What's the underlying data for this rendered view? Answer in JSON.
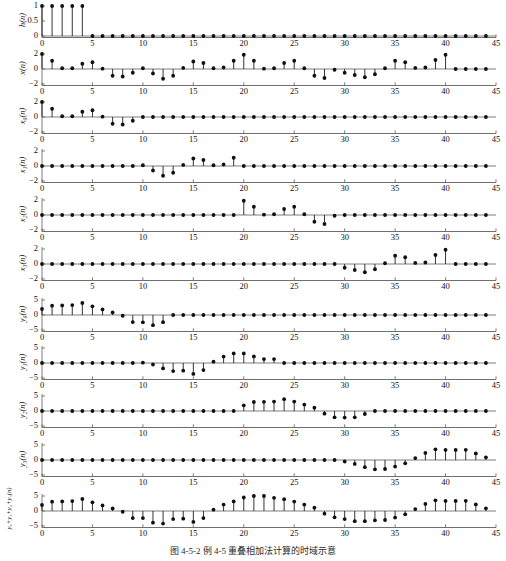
{
  "figure": {
    "caption": "图 4-5-2   例 4-5 重叠相加法计算的时域示意",
    "width": 506,
    "height": 561,
    "stem_color": "#101010",
    "axis_color": "#6f6f6f",
    "background": "#ffffff"
  },
  "axes": {
    "xlabel": "",
    "xticks": [
      0,
      5,
      10,
      15,
      20,
      25,
      30,
      35,
      40,
      45
    ],
    "xlim": [
      0,
      45
    ],
    "yticks_unit": [
      "1",
      "0.5",
      "0"
    ],
    "yticks_two": [
      "2",
      "0",
      "−2"
    ],
    "yticks_five": [
      "5",
      "0",
      "−5"
    ]
  },
  "chart_data": {
    "type": "line",
    "subtype": "stem",
    "title": "图 4-5-2   例 4-5 重叠相加法计算的时域示意",
    "xlabel": "n",
    "shared_x": [
      0,
      1,
      2,
      3,
      4,
      5,
      6,
      7,
      8,
      9,
      10,
      11,
      12,
      13,
      14,
      15,
      16,
      17,
      18,
      19,
      20,
      21,
      22,
      23,
      24,
      25,
      26,
      27,
      28,
      29,
      30,
      31,
      32,
      33,
      34,
      35,
      36,
      37,
      38,
      39,
      40,
      41,
      42,
      43,
      44
    ],
    "grid": false,
    "legend": null,
    "panels": [
      {
        "name": "h",
        "ylabel": "h(n)",
        "ylim": [
          0,
          1
        ],
        "yticks": [
          0,
          0.5,
          1
        ],
        "ytick_labels": [
          "0",
          "0.5",
          "1"
        ],
        "values": [
          1,
          1,
          1,
          1,
          1,
          0,
          0,
          0,
          0,
          0,
          0,
          0,
          0,
          0,
          0,
          0,
          0,
          0,
          0,
          0,
          0,
          0,
          0,
          0,
          0,
          0,
          0,
          0,
          0,
          0,
          0,
          0,
          0,
          0,
          0,
          0,
          0,
          0,
          0,
          0,
          0,
          0,
          0,
          0,
          0
        ]
      },
      {
        "name": "x",
        "ylabel": "x(n)",
        "ylim": [
          -2,
          2
        ],
        "yticks": [
          -2,
          0,
          2
        ],
        "ytick_labels": [
          "−2",
          "0",
          "2"
        ],
        "values": [
          2.0,
          1.1,
          0.1,
          0.1,
          0.7,
          0.9,
          0.05,
          -0.9,
          -1.0,
          -0.5,
          0.1,
          -0.6,
          -1.3,
          -0.9,
          0.15,
          1.0,
          0.8,
          0.1,
          0.2,
          1.1,
          1.9,
          1.1,
          0.05,
          0.1,
          0.8,
          1.1,
          0.1,
          -0.9,
          -1.2,
          -0.1,
          -0.5,
          -0.8,
          -1.1,
          -0.7,
          0.1,
          1.1,
          0.9,
          0.15,
          0.2,
          1.2,
          1.9,
          0,
          0,
          0,
          0
        ]
      },
      {
        "name": "x0",
        "ylabel": "x₀(n)",
        "ylim": [
          -2,
          2
        ],
        "yticks": [
          -2,
          0,
          2
        ],
        "ytick_labels": [
          "−2",
          "0",
          "2"
        ],
        "values": [
          2.0,
          1.1,
          0.1,
          0.1,
          0.7,
          0.9,
          0.05,
          -0.9,
          -1.0,
          -0.5,
          0,
          0,
          0,
          0,
          0,
          0,
          0,
          0,
          0,
          0,
          0,
          0,
          0,
          0,
          0,
          0,
          0,
          0,
          0,
          0,
          0,
          0,
          0,
          0,
          0,
          0,
          0,
          0,
          0,
          0,
          0,
          0,
          0,
          0,
          0
        ]
      },
      {
        "name": "x1",
        "ylabel": "x₁(n)",
        "ylim": [
          -2,
          2
        ],
        "yticks": [
          -2,
          0,
          2
        ],
        "ytick_labels": [
          "−2",
          "0",
          "2"
        ],
        "values": [
          0,
          0,
          0,
          0,
          0,
          0,
          0,
          0,
          0,
          0,
          0.1,
          -0.6,
          -1.3,
          -0.9,
          0.15,
          1.0,
          0.8,
          0.1,
          0.2,
          1.1,
          0,
          0,
          0,
          0,
          0,
          0,
          0,
          0,
          0,
          0,
          0,
          0,
          0,
          0,
          0,
          0,
          0,
          0,
          0,
          0,
          0,
          0,
          0,
          0,
          0
        ]
      },
      {
        "name": "x2",
        "ylabel": "x₂(n)",
        "ylim": [
          -2,
          2
        ],
        "yticks": [
          -2,
          0,
          2
        ],
        "ytick_labels": [
          "−2",
          "0",
          "2"
        ],
        "values": [
          0,
          0,
          0,
          0,
          0,
          0,
          0,
          0,
          0,
          0,
          0,
          0,
          0,
          0,
          0,
          0,
          0,
          0,
          0,
          0,
          1.9,
          1.1,
          0.05,
          0.1,
          0.8,
          1.1,
          0.1,
          -0.9,
          -1.2,
          -0.1,
          0,
          0,
          0,
          0,
          0,
          0,
          0,
          0,
          0,
          0,
          0,
          0,
          0,
          0,
          0
        ]
      },
      {
        "name": "x3",
        "ylabel": "x₃(n)",
        "ylim": [
          -2,
          2
        ],
        "yticks": [
          -2,
          0,
          2
        ],
        "ytick_labels": [
          "−2",
          "0",
          "2"
        ],
        "values": [
          0,
          0,
          0,
          0,
          0,
          0,
          0,
          0,
          0,
          0,
          0,
          0,
          0,
          0,
          0,
          0,
          0,
          0,
          0,
          0,
          0,
          0,
          0,
          0,
          0,
          0,
          0,
          0,
          0,
          0,
          -0.5,
          -0.8,
          -1.1,
          -0.7,
          0.1,
          1.1,
          0.9,
          0.15,
          0.2,
          1.2,
          1.9,
          0,
          0,
          0,
          0
        ]
      },
      {
        "name": "y0",
        "ylabel": "y₀(n)",
        "ylim": [
          -5,
          5
        ],
        "yticks": [
          -5,
          0,
          5
        ],
        "ytick_labels": [
          "−5",
          "0",
          "5"
        ],
        "values": [
          2.0,
          3.1,
          3.2,
          3.3,
          4.0,
          2.9,
          1.85,
          0.85,
          -0.25,
          -2.35,
          -2.45,
          -3.4,
          -2.4,
          0,
          0,
          0,
          0,
          0,
          0,
          0,
          0,
          0,
          0,
          0,
          0,
          0,
          0,
          0,
          0,
          0,
          0,
          0,
          0,
          0,
          0,
          0,
          0,
          0,
          0,
          0,
          0,
          0,
          0,
          0,
          0
        ]
      },
      {
        "name": "y1",
        "ylabel": "y₁(n)",
        "ylim": [
          -5,
          5
        ],
        "yticks": [
          -5,
          0,
          5
        ],
        "ytick_labels": [
          "−5",
          "0",
          "5"
        ],
        "values": [
          0,
          0,
          0,
          0,
          0,
          0,
          0,
          0,
          0,
          0,
          0.1,
          -0.5,
          -1.8,
          -2.7,
          -2.55,
          -3.65,
          -2.35,
          0.45,
          2.15,
          3.2,
          3.2,
          2.2,
          1.3,
          1.3,
          0,
          0,
          0,
          0,
          0,
          0,
          0,
          0,
          0,
          0,
          0,
          0,
          0,
          0,
          0,
          0,
          0,
          0,
          0,
          0,
          0
        ]
      },
      {
        "name": "y2",
        "ylabel": "y₂(n)",
        "ylim": [
          -5,
          5
        ],
        "yticks": [
          -5,
          0,
          5
        ],
        "ytick_labels": [
          "−5",
          "0",
          "5"
        ],
        "values": [
          0,
          0,
          0,
          0,
          0,
          0,
          0,
          0,
          0,
          0,
          0,
          0,
          0,
          0,
          0,
          0,
          0,
          0,
          0,
          0,
          1.9,
          3.0,
          3.05,
          3.15,
          3.95,
          3.15,
          2.15,
          1.1,
          -0.9,
          -2.1,
          -2.2,
          -2.1,
          -1.0,
          0,
          0,
          0,
          0,
          0,
          0,
          0,
          0,
          0,
          0,
          0,
          0
        ]
      },
      {
        "name": "y3",
        "ylabel": "y₃(n)",
        "ylim": [
          -5,
          5
        ],
        "yticks": [
          -5,
          0,
          5
        ],
        "ytick_labels": [
          "−5",
          "0",
          "5"
        ],
        "values": [
          0,
          0,
          0,
          0,
          0,
          0,
          0,
          0,
          0,
          0,
          0,
          0,
          0,
          0,
          0,
          0,
          0,
          0,
          0,
          0,
          0,
          0,
          0,
          0,
          0,
          0,
          0,
          0,
          0,
          0,
          -0.5,
          -1.3,
          -2.4,
          -3.1,
          -3.0,
          -2.2,
          -1.1,
          0.65,
          2.35,
          3.55,
          3.35,
          3.35,
          3.4,
          2.2,
          0.9
        ]
      },
      {
        "name": "ysum",
        "ylabel": "y₀+y₁+y₂+y₃(n)",
        "ylim": [
          -5,
          5
        ],
        "yticks": [
          -5,
          0,
          5
        ],
        "ytick_labels": [
          "−5",
          "0",
          "5"
        ],
        "values": [
          2.0,
          3.1,
          3.2,
          3.3,
          4.0,
          2.9,
          1.85,
          0.85,
          -0.25,
          -2.35,
          -2.35,
          -3.9,
          -4.2,
          -2.7,
          -2.55,
          -3.65,
          -2.35,
          0.45,
          2.15,
          3.2,
          4.5,
          5.0,
          5.0,
          4.4,
          3.95,
          3.15,
          2.15,
          1.1,
          -0.9,
          -2.1,
          -2.7,
          -3.4,
          -3.4,
          -3.1,
          -3.0,
          -2.2,
          -1.1,
          0.65,
          2.35,
          3.55,
          3.35,
          3.35,
          3.4,
          2.2,
          0.9
        ]
      }
    ]
  }
}
